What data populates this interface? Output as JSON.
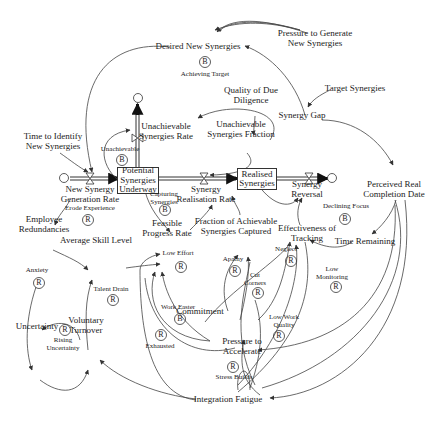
{
  "stocks": {
    "potential": "Potential\nSynergies\nUnderway",
    "realised": "Realised\nSynergies"
  },
  "variables": {
    "desired_new_synergies": "Desired New Synergies",
    "pressure_to_generate": "Pressure to Generate\nNew Synergies",
    "achieving_target_loop": "Achieving Target",
    "quality_due_diligence": "Quality of Due\nDiligence",
    "target_synergies": "Target Synergies",
    "synergy_gap": "Synergy Gap",
    "unachievable_rate": "Unachievable\nSynergies Rate",
    "unachievable_fraction": "Unachievable\nSynergies Fraction",
    "time_to_identify": "Time to Identify\nNew Synergies",
    "unachievable_loop": "Unachievable",
    "new_synergy_rate": "New Synergy\nGeneration Rate",
    "synergy_realisation_rate": "Synergy\nRealisation Rate",
    "synergy_reversal": "Synergy\nReversal",
    "perceived_completion": "Perceived Real\nCompletion Date",
    "erode_experience": "Erode Experience",
    "capturing_synergies": "Capturing\nSynergies",
    "employee_redundancies": "Employee\nRedundancies",
    "feasible_progress_rate": "Feasible\nProgress Rate",
    "fraction_achievable": "Fraction of Achievable\nSynergies Captured",
    "effectiveness_tracking": "Effectiveness of\nTracking",
    "declining_focus": "Declining Focus",
    "neglect": "Neglect",
    "time_remaining": "Time Remaining",
    "average_skill": "Average Skill Level",
    "low_effort": "Low Effort",
    "apathy": "Apathy",
    "low_monitoring": "Low\nMonitoring",
    "anxiety": "Anxiety",
    "talent_drain": "Talent Drain",
    "cut_corners": "Cut\nCorners",
    "uncertainty": "Uncertainty",
    "voluntary_turnover": "Voluntary\nTurnover",
    "rising_uncertainty": "Rising\nUncertainty",
    "work_faster": "Work Faster",
    "commitment": "Commitment",
    "low_work_quality": "Low Work\nQuality",
    "exhausted": "Exhausted",
    "pressure_to_accelerate": "Pressure to\nAccelerate",
    "stress_builds": "Stress Builds",
    "integration_fatigue": "Integration Fatigue"
  },
  "loops": {
    "achieving_target": "B",
    "unachievable": "B",
    "erode_experience": "R",
    "capturing_synergies": "B",
    "declining_focus": "B",
    "neglect": "R",
    "low_effort": "R",
    "apathy": "R",
    "low_monitoring": "R",
    "anxiety": "R",
    "talent_drain": "R",
    "cut_corners": "R",
    "rising_uncertainty": "R",
    "work_faster": "B",
    "low_work_quality": "R",
    "exhausted": "R",
    "stress_builds": "R"
  },
  "colors": {
    "line": "#444444",
    "text": "#222222",
    "background": "#ffffff"
  }
}
